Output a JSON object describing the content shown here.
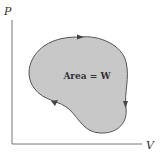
{
  "diagram": {
    "type": "pv-cycle",
    "y_axis_label": "P",
    "x_axis_label": "V",
    "area_label": "Area = W",
    "cycle_direction": "clockwise",
    "colors": {
      "fill": "#c8c8c8",
      "outline": "#555555",
      "axis": "#777777",
      "text": "#333333"
    }
  }
}
